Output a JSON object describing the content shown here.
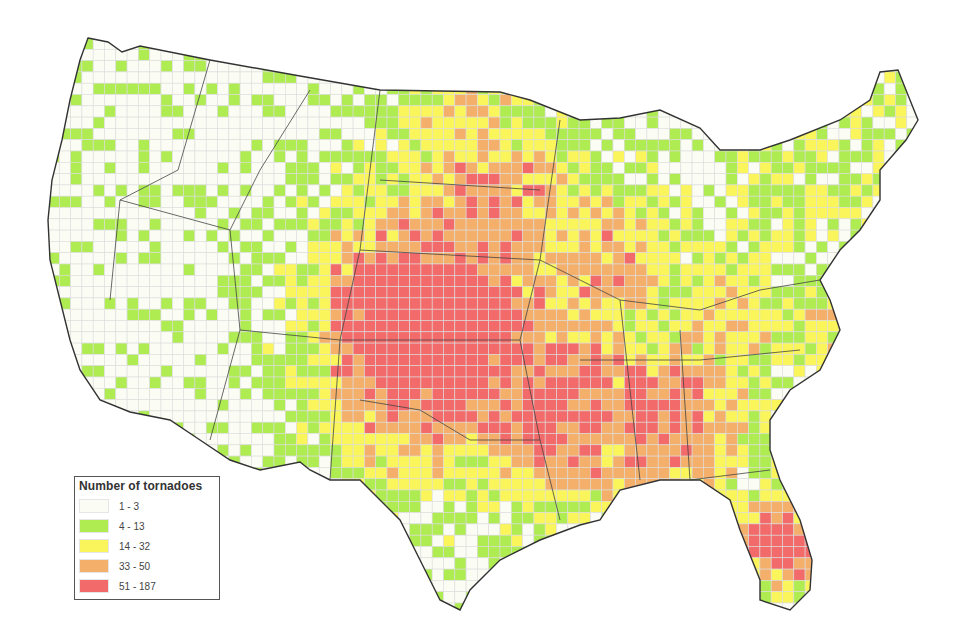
{
  "map": {
    "title": "Number of tornadoes by grid cell, contiguous United States",
    "chart_data": {
      "type": "heatmap",
      "legend_placement": "bottom-left",
      "legend": {
        "title": "Number of tornadoes",
        "classes": [
          {
            "label": "1 - 3",
            "min": 1,
            "max": 3,
            "color": "#fbfdf4"
          },
          {
            "label": "4 - 13",
            "min": 4,
            "max": 13,
            "color": "#aeec52"
          },
          {
            "label": "14 - 32",
            "min": 14,
            "max": 32,
            "color": "#f9f55a"
          },
          {
            "label": "33 - 50",
            "min": 33,
            "max": 50,
            "color": "#f4b06a"
          },
          {
            "label": "51 - 187",
            "min": 51,
            "max": 187,
            "color": "#f36a6a"
          }
        ]
      },
      "regions": [
        {
          "name": "Pacific Northwest",
          "dominant_class": "1 - 3"
        },
        {
          "name": "Intermountain West",
          "dominant_class": "1 - 3"
        },
        {
          "name": "Northern Plains",
          "dominant_class": "14 - 32"
        },
        {
          "name": "Central Plains",
          "dominant_class": "51 - 187"
        },
        {
          "name": "Southern Plains",
          "dominant_class": "51 - 187"
        },
        {
          "name": "Midwest",
          "dominant_class": "33 - 50"
        },
        {
          "name": "Southeast",
          "dominant_class": "33 - 50"
        },
        {
          "name": "Florida",
          "dominant_class": "51 - 187"
        },
        {
          "name": "Northeast",
          "dominant_class": "4 - 13"
        },
        {
          "name": "West Texas",
          "dominant_class": "4 - 13"
        }
      ]
    }
  }
}
